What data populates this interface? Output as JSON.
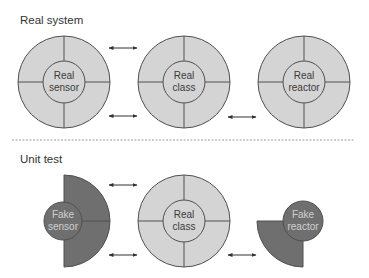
{
  "colors": {
    "real_fill": "#d4d4d4",
    "fake_fill": "#6f6f6f",
    "stroke": "#505050",
    "divider": "#9a9a9a"
  },
  "sections": [
    {
      "label": "Real system",
      "nodes": [
        {
          "line1": "Real",
          "line2": "sensor",
          "kind": "real"
        },
        {
          "line1": "Real",
          "line2": "class",
          "kind": "real"
        },
        {
          "line1": "Real",
          "line2": "reactor",
          "kind": "real"
        }
      ],
      "arrows": [
        "sensor-class-top",
        "sensor-class-bottom",
        "class-reactor-bottom"
      ]
    },
    {
      "label": "Unit test",
      "nodes": [
        {
          "line1": "Fake",
          "line2": "sensor",
          "kind": "fake-half"
        },
        {
          "line1": "Real",
          "line2": "class",
          "kind": "real"
        },
        {
          "line1": "Fake",
          "line2": "reactor",
          "kind": "fake-quarter"
        }
      ],
      "arrows": [
        "sensor-class-top",
        "sensor-class-bottom",
        "class-reactor-bottom"
      ]
    }
  ]
}
